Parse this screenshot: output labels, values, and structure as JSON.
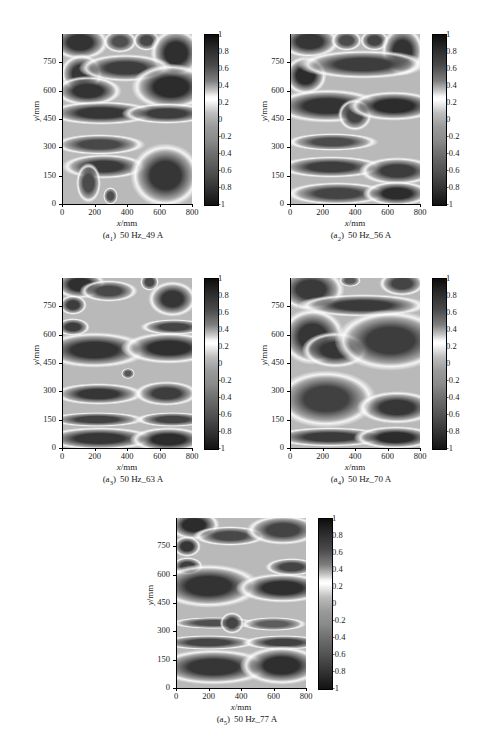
{
  "figure": {
    "background_color": "#ffffff",
    "panel_count": 5
  },
  "axes": {
    "x_title_var": "x",
    "x_title_unit": "/mm",
    "y_title_var": "y",
    "y_title_unit": "/mm",
    "x_ticks": [
      "0",
      "200",
      "400",
      "600",
      "800"
    ],
    "y_ticks": [
      "0",
      "150",
      "300",
      "450",
      "600",
      "750"
    ],
    "colorbar_ticks": [
      "1",
      "0.8",
      "0.6",
      "0.4",
      "0.2",
      "0",
      "-0.2",
      "-0.4",
      "-0.6",
      "-0.8",
      "-1"
    ]
  },
  "panels": [
    {
      "id": "a1",
      "tag": "(a",
      "sub": "1",
      "tag_close": ")",
      "caption": "50 Hz_49 A",
      "frequency": "50 Hz",
      "current": "49 A"
    },
    {
      "id": "a2",
      "tag": "(a",
      "sub": "2",
      "tag_close": ")",
      "caption": "50 Hz_56 A",
      "frequency": "50 Hz",
      "current": "56 A"
    },
    {
      "id": "a3",
      "tag": "(a",
      "sub": "3",
      "tag_close": ")",
      "caption": "50 Hz_63 A",
      "frequency": "50 Hz",
      "current": "63 A"
    },
    {
      "id": "a4",
      "tag": "(a",
      "sub": "4",
      "tag_close": ")",
      "caption": "50 Hz_70 A",
      "frequency": "50 Hz",
      "current": "70 A"
    },
    {
      "id": "a5",
      "tag": "(a",
      "sub": "5",
      "tag_close": ")",
      "caption": "50 Hz_77 A",
      "frequency": "50 Hz",
      "current": "77 A"
    }
  ],
  "chart_data": {
    "type": "heatmap",
    "title": "",
    "xlabel": "x/mm",
    "ylabel": "y/mm",
    "xlim": [
      0,
      800
    ],
    "ylim": [
      0,
      900
    ],
    "zlim": [
      -1,
      1
    ],
    "colormap": "gray (dark=+1 and -1, white near +0.2)",
    "grid": false,
    "legend": "colorbar right of each panel",
    "subplots": [
      {
        "label": "(a1) 50 Hz_49 A",
        "x_ticks": [
          0,
          200,
          400,
          600,
          800
        ],
        "y_ticks": [
          0,
          150,
          300,
          450,
          600,
          750
        ],
        "colorbar_ticks": [
          1,
          0.8,
          0.6,
          0.4,
          0.2,
          0,
          -0.2,
          -0.4,
          -0.6,
          -0.8,
          -1
        ],
        "features": [
          {
            "cx": 110,
            "cy": 855,
            "rx": 95,
            "ry": 48,
            "value": -0.85
          },
          {
            "cx": 355,
            "cy": 860,
            "rx": 55,
            "ry": 32,
            "value": -0.45
          },
          {
            "cx": 520,
            "cy": 865,
            "rx": 45,
            "ry": 30,
            "value": -0.55
          },
          {
            "cx": 700,
            "cy": 800,
            "rx": 85,
            "ry": 70,
            "value": -0.9
          },
          {
            "cx": 120,
            "cy": 690,
            "rx": 70,
            "ry": 55,
            "value": -0.8
          },
          {
            "cx": 390,
            "cy": 720,
            "rx": 150,
            "ry": 40,
            "value": -0.7
          },
          {
            "cx": 160,
            "cy": 600,
            "rx": 110,
            "ry": 42,
            "value": -0.85
          },
          {
            "cx": 670,
            "cy": 620,
            "rx": 130,
            "ry": 65,
            "value": -0.95
          },
          {
            "cx": 245,
            "cy": 480,
            "rx": 180,
            "ry": 33,
            "value": -0.8
          },
          {
            "cx": 645,
            "cy": 480,
            "rx": 145,
            "ry": 30,
            "value": -0.7
          },
          {
            "cx": 230,
            "cy": 315,
            "rx": 150,
            "ry": 28,
            "value": -0.55
          },
          {
            "cx": 260,
            "cy": 200,
            "rx": 140,
            "ry": 35,
            "value": -0.75
          },
          {
            "cx": 165,
            "cy": 110,
            "rx": 40,
            "ry": 55,
            "value": -0.5
          },
          {
            "cx": 300,
            "cy": 40,
            "rx": 25,
            "ry": 25,
            "value": -0.45
          },
          {
            "cx": 640,
            "cy": 150,
            "rx": 115,
            "ry": 90,
            "value": -0.8
          }
        ]
      },
      {
        "label": "(a2) 50 Hz_56 A",
        "x_ticks": [
          0,
          200,
          400,
          600,
          800
        ],
        "y_ticks": [
          0,
          150,
          300,
          450,
          600,
          750
        ],
        "colorbar_ticks": [
          1,
          0.8,
          0.6,
          0.4,
          0.2,
          0,
          -0.2,
          -0.4,
          -0.6,
          -0.8,
          -1
        ],
        "features": [
          {
            "cx": 120,
            "cy": 860,
            "rx": 100,
            "ry": 45,
            "value": -0.8
          },
          {
            "cx": 350,
            "cy": 865,
            "rx": 50,
            "ry": 30,
            "value": -0.5
          },
          {
            "cx": 520,
            "cy": 865,
            "rx": 48,
            "ry": 30,
            "value": -0.6
          },
          {
            "cx": 690,
            "cy": 810,
            "rx": 70,
            "ry": 70,
            "value": -0.85
          },
          {
            "cx": 95,
            "cy": 680,
            "rx": 70,
            "ry": 55,
            "value": -0.95
          },
          {
            "cx": 450,
            "cy": 740,
            "rx": 210,
            "ry": 40,
            "value": -0.7
          },
          {
            "cx": 230,
            "cy": 520,
            "rx": 180,
            "ry": 48,
            "value": -0.85
          },
          {
            "cx": 400,
            "cy": 470,
            "rx": 55,
            "ry": 45,
            "value": -0.6
          },
          {
            "cx": 640,
            "cy": 520,
            "rx": 150,
            "ry": 42,
            "value": -0.95
          },
          {
            "cx": 260,
            "cy": 330,
            "rx": 150,
            "ry": 25,
            "value": -0.5
          },
          {
            "cx": 250,
            "cy": 195,
            "rx": 175,
            "ry": 30,
            "value": -0.7
          },
          {
            "cx": 660,
            "cy": 175,
            "rx": 125,
            "ry": 40,
            "value": -0.7
          },
          {
            "cx": 290,
            "cy": 55,
            "rx": 170,
            "ry": 32,
            "value": -0.6
          },
          {
            "cx": 660,
            "cy": 55,
            "rx": 110,
            "ry": 35,
            "value": -0.95
          }
        ]
      },
      {
        "label": "(a3) 50 Hz_63 A",
        "x_ticks": [
          0,
          200,
          400,
          600,
          800
        ],
        "y_ticks": [
          0,
          150,
          300,
          450,
          600,
          750
        ],
        "colorbar_ticks": [
          1,
          0.8,
          0.6,
          0.4,
          0.2,
          0,
          -0.2,
          -0.4,
          -0.6,
          -0.8,
          -1
        ],
        "features": [
          {
            "cx": 110,
            "cy": 865,
            "rx": 85,
            "ry": 40,
            "value": -0.9
          },
          {
            "cx": 290,
            "cy": 830,
            "rx": 95,
            "ry": 30,
            "value": -0.55
          },
          {
            "cx": 540,
            "cy": 880,
            "rx": 30,
            "ry": 25,
            "value": -0.55
          },
          {
            "cx": 680,
            "cy": 790,
            "rx": 80,
            "ry": 50,
            "value": -0.8
          },
          {
            "cx": 70,
            "cy": 755,
            "rx": 45,
            "ry": 28,
            "value": -0.7
          },
          {
            "cx": 70,
            "cy": 640,
            "rx": 55,
            "ry": 25,
            "value": -0.7
          },
          {
            "cx": 690,
            "cy": 640,
            "rx": 110,
            "ry": 22,
            "value": -0.6
          },
          {
            "cx": 200,
            "cy": 520,
            "rx": 175,
            "ry": 50,
            "value": -0.85
          },
          {
            "cx": 660,
            "cy": 530,
            "rx": 155,
            "ry": 45,
            "value": -0.9
          },
          {
            "cx": 405,
            "cy": 395,
            "rx": 22,
            "ry": 16,
            "value": -0.35
          },
          {
            "cx": 225,
            "cy": 285,
            "rx": 150,
            "ry": 30,
            "value": -0.8
          },
          {
            "cx": 645,
            "cy": 290,
            "rx": 105,
            "ry": 35,
            "value": -0.7
          },
          {
            "cx": 215,
            "cy": 150,
            "rx": 160,
            "ry": 20,
            "value": -0.65
          },
          {
            "cx": 680,
            "cy": 150,
            "rx": 120,
            "ry": 20,
            "value": -0.6
          },
          {
            "cx": 230,
            "cy": 50,
            "rx": 185,
            "ry": 32,
            "value": -0.8
          },
          {
            "cx": 655,
            "cy": 45,
            "rx": 125,
            "ry": 35,
            "value": -0.95
          }
        ]
      },
      {
        "label": "(a4) 50 Hz_70 A",
        "x_ticks": [
          0,
          200,
          400,
          600,
          800
        ],
        "y_ticks": [
          0,
          150,
          300,
          450,
          600,
          750
        ],
        "colorbar_ticks": [
          1,
          0.8,
          0.6,
          0.4,
          0.2,
          0,
          -0.2,
          -0.4,
          -0.6,
          -0.8,
          -1
        ],
        "features": [
          {
            "cx": 130,
            "cy": 840,
            "rx": 110,
            "ry": 60,
            "value": -0.75
          },
          {
            "cx": 370,
            "cy": 885,
            "rx": 35,
            "ry": 18,
            "value": -0.3
          },
          {
            "cx": 690,
            "cy": 870,
            "rx": 75,
            "ry": 35,
            "value": -0.6
          },
          {
            "cx": 450,
            "cy": 755,
            "rx": 215,
            "ry": 32,
            "value": -0.75
          },
          {
            "cx": 140,
            "cy": 590,
            "rx": 105,
            "ry": 80,
            "value": -0.8
          },
          {
            "cx": 280,
            "cy": 520,
            "rx": 110,
            "ry": 50,
            "value": -0.8
          },
          {
            "cx": 620,
            "cy": 570,
            "rx": 180,
            "ry": 85,
            "value": -0.7
          },
          {
            "cx": 220,
            "cy": 260,
            "rx": 165,
            "ry": 80,
            "value": -0.65
          },
          {
            "cx": 660,
            "cy": 215,
            "rx": 130,
            "ry": 45,
            "value": -0.8
          },
          {
            "cx": 245,
            "cy": 60,
            "rx": 195,
            "ry": 28,
            "value": -0.75
          },
          {
            "cx": 650,
            "cy": 55,
            "rx": 135,
            "ry": 32,
            "value": -0.95
          }
        ]
      },
      {
        "label": "(a5) 50 Hz_77 A",
        "x_ticks": [
          0,
          200,
          400,
          600,
          800
        ],
        "y_ticks": [
          0,
          150,
          300,
          450,
          600,
          750
        ],
        "colorbar_ticks": [
          1,
          0.8,
          0.6,
          0.4,
          0.2,
          0,
          -0.2,
          -0.4,
          -0.6,
          -0.8,
          -1
        ],
        "features": [
          {
            "cx": 110,
            "cy": 865,
            "rx": 85,
            "ry": 42,
            "value": -0.95
          },
          {
            "cx": 330,
            "cy": 805,
            "rx": 120,
            "ry": 28,
            "value": -0.55
          },
          {
            "cx": 660,
            "cy": 835,
            "rx": 120,
            "ry": 42,
            "value": -0.6
          },
          {
            "cx": 70,
            "cy": 750,
            "rx": 45,
            "ry": 30,
            "value": -0.8
          },
          {
            "cx": 70,
            "cy": 645,
            "rx": 50,
            "ry": 25,
            "value": -0.7
          },
          {
            "cx": 710,
            "cy": 640,
            "rx": 85,
            "ry": 25,
            "value": -0.6
          },
          {
            "cx": 200,
            "cy": 540,
            "rx": 170,
            "ry": 60,
            "value": -0.85
          },
          {
            "cx": 655,
            "cy": 530,
            "rx": 150,
            "ry": 42,
            "value": -0.9
          },
          {
            "cx": 230,
            "cy": 345,
            "rx": 140,
            "ry": 16,
            "value": -0.45
          },
          {
            "cx": 345,
            "cy": 345,
            "rx": 40,
            "ry": 30,
            "value": -0.6
          },
          {
            "cx": 600,
            "cy": 340,
            "rx": 110,
            "ry": 20,
            "value": -0.25
          },
          {
            "cx": 200,
            "cy": 240,
            "rx": 160,
            "ry": 20,
            "value": -0.6
          },
          {
            "cx": 660,
            "cy": 240,
            "rx": 135,
            "ry": 20,
            "value": -0.65
          },
          {
            "cx": 230,
            "cy": 110,
            "rx": 190,
            "ry": 50,
            "value": -0.8
          },
          {
            "cx": 650,
            "cy": 120,
            "rx": 135,
            "ry": 55,
            "value": -0.9
          }
        ]
      }
    ]
  }
}
